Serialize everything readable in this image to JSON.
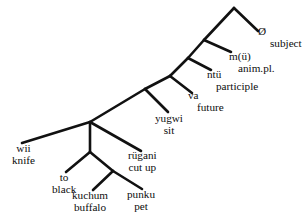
{
  "diagram": {
    "type": "syntax-tree",
    "line_color": "#111111",
    "text_color": "#0d0d0d",
    "background": "#ffffff",
    "width": 306,
    "height": 221,
    "nodes": [
      {
        "id": "root",
        "x": 234,
        "y": 8
      },
      {
        "id": "n1",
        "x": 204,
        "y": 40
      },
      {
        "id": "n2",
        "x": 188,
        "y": 58
      },
      {
        "id": "n3",
        "x": 170,
        "y": 76
      },
      {
        "id": "n4",
        "x": 145,
        "y": 89
      },
      {
        "id": "n5",
        "x": 90,
        "y": 122
      },
      {
        "id": "n6",
        "x": 90,
        "y": 152
      },
      {
        "id": "n7",
        "x": 113,
        "y": 171
      }
    ],
    "edges": [
      {
        "from": "root",
        "to_x": 258,
        "to_y": 31,
        "label": "root-to-subject"
      },
      {
        "from": "root",
        "to_x": 204,
        "to_y": 40,
        "label": "root-to-n1"
      },
      {
        "from": "n1",
        "to_x": 231,
        "to_y": 52,
        "label": "n1-to-animpl"
      },
      {
        "from": "n1",
        "to_x": 188,
        "to_y": 58,
        "label": "n1-to-n2"
      },
      {
        "from": "n2",
        "to_x": 211,
        "to_y": 70,
        "label": "n2-to-participle"
      },
      {
        "from": "n2",
        "to_x": 170,
        "to_y": 76,
        "label": "n2-to-n3"
      },
      {
        "from": "n3",
        "to_x": 192,
        "to_y": 93,
        "label": "n3-to-future"
      },
      {
        "from": "n3",
        "to_x": 145,
        "to_y": 89,
        "label": "n3-to-n4"
      },
      {
        "from": "n4",
        "to_x": 168,
        "to_y": 112,
        "label": "n4-to-sit"
      },
      {
        "from": "n4",
        "to_x": 90,
        "to_y": 122,
        "label": "n4-to-n5"
      },
      {
        "from": "n5",
        "to_x": 22,
        "to_y": 143,
        "label": "n5-to-knife"
      },
      {
        "from": "n5",
        "to_x": 90,
        "to_y": 152,
        "label": "n5-to-n6-vertical"
      },
      {
        "from": "n5",
        "to_x": 141,
        "to_y": 151,
        "label": "n5-to-cutup"
      },
      {
        "from": "n6",
        "to_x": 66,
        "to_y": 172,
        "label": "n6-to-black"
      },
      {
        "from": "n6",
        "to_x": 113,
        "to_y": 171,
        "label": "n6-to-n7"
      },
      {
        "from": "n7",
        "to_x": 93,
        "to_y": 190,
        "label": "n7-to-buffalo"
      },
      {
        "from": "n7",
        "to_x": 142,
        "to_y": 189,
        "label": "n7-to-pet"
      }
    ],
    "leaves": [
      {
        "id": "subject",
        "form": "Ø",
        "gloss": "subject",
        "x": 258,
        "y": 26,
        "align": "left",
        "indent": 2
      },
      {
        "id": "anim-pl",
        "form": "m(ü)",
        "gloss": "anim.pl.",
        "x": 229,
        "y": 51,
        "align": "left",
        "indent": 1
      },
      {
        "id": "participle",
        "form": "ntü",
        "gloss": "participle",
        "x": 207,
        "y": 69,
        "align": "left",
        "indent": 1
      },
      {
        "id": "future",
        "form": "va",
        "gloss": "future",
        "x": 188,
        "y": 90,
        "align": "left",
        "indent": 1
      },
      {
        "id": "sit",
        "form": "yugwi",
        "gloss": "sit",
        "x": 155,
        "y": 113,
        "align": "center",
        "indent": 0
      },
      {
        "id": "knife",
        "form": "wii",
        "gloss": "knife",
        "x": 12,
        "y": 143,
        "align": "center",
        "indent": 0
      },
      {
        "id": "cut-up",
        "form": "rügani",
        "gloss": "cut up",
        "x": 128,
        "y": 150,
        "align": "center",
        "indent": 0
      },
      {
        "id": "black",
        "form": "to",
        "gloss": "black",
        "x": 52,
        "y": 172,
        "align": "center",
        "indent": 0
      },
      {
        "id": "buffalo",
        "form": "kuchum",
        "gloss": "buffalo",
        "x": 72,
        "y": 190,
        "align": "center",
        "indent": 0
      },
      {
        "id": "pet",
        "form": "punku",
        "gloss": "pet",
        "x": 127,
        "y": 189,
        "align": "center",
        "indent": 0
      }
    ]
  }
}
